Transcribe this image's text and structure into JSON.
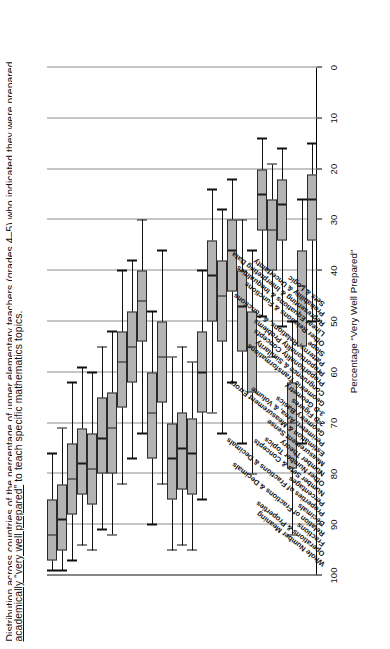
{
  "caption": {
    "line_clipped": "Distribution across countries of the percentage of upper elementary teachers (grades 4–5) who indicated they were prepared",
    "line2_a": "academically “very well prepared”",
    "line2_b": " to teach specific mathematics topics."
  },
  "axis": {
    "y_title": "Percentage “Very Well Prepared”",
    "y_ticks": [
      100,
      90,
      80,
      70,
      60,
      50,
      40,
      30,
      20,
      10,
      0
    ],
    "y_min": 0,
    "y_max": 100
  },
  "style": {
    "box_fill": "#b3b3b3",
    "box_stroke": "#2b2b2b",
    "grid_color": "#8d8d8d",
    "whisker_color": "#111111"
  },
  "chart_data": {
    "type": "box",
    "title": "",
    "xlabel": "",
    "ylabel": "Percentage “Very Well Prepared”",
    "ylim": [
      0,
      100
    ],
    "grid": "vertical",
    "orientation": "horizontal",
    "legend": "none",
    "categories": [
      "Whole Number Meaning",
      "Operations & Properties",
      "Fractions",
      "Relation of Fractions & Decimals",
      "Decimals",
      "Properties of Fractions & Decimals",
      "Percentages",
      "Number Sets & Concepts",
      "Other Number Topics",
      "Number Theory",
      "Measurement Sense",
      "Estimation & Measurement Errors",
      "Perimeter, Area, & Volume",
      "Geometry Basics",
      "2-D Figures",
      "3-D Geometry",
      "Geometric Transformations",
      "Congruence & Similarity",
      "Proportionality Concepts",
      "Proportionality Problems",
      "Patterns, Relations, & Functions",
      "Slope",
      "Other Relations & Functions",
      "Linear Equations & Inequalities",
      "Representing & Interpreting Data",
      "Probability & Uncertainty",
      "Sets & Logic"
    ],
    "boxes": [
      {
        "category": "Whole Number Meaning",
        "min": 76,
        "q1": 85,
        "median": 92,
        "q3": 97,
        "max": 99
      },
      {
        "category": "Operations & Properties",
        "min": 71,
        "q1": 82,
        "median": 89,
        "q3": 95,
        "max": 99
      },
      {
        "category": "Fractions",
        "min": 62,
        "q1": 74,
        "median": 81,
        "q3": 88,
        "max": 97
      },
      {
        "category": "Relation of Fractions & Decimals",
        "min": 59,
        "q1": 71,
        "median": 78,
        "q3": 84,
        "max": 94
      },
      {
        "category": "Decimals",
        "min": 60,
        "q1": 72,
        "median": 79,
        "q3": 86,
        "max": 95
      },
      {
        "category": "Properties of Fractions & Decimals",
        "min": 55,
        "q1": 65,
        "median": 73,
        "q3": 80,
        "max": 91
      },
      {
        "category": "Percentages",
        "min": 52,
        "q1": 64,
        "median": 71,
        "q3": 80,
        "max": 92
      },
      {
        "category": "Number Sets & Concepts",
        "min": 40,
        "q1": 52,
        "median": 58,
        "q3": 67,
        "max": 82
      },
      {
        "category": "Other Number Topics",
        "min": 38,
        "q1": 48,
        "median": 55,
        "q3": 62,
        "max": 77
      },
      {
        "category": "Number Theory",
        "min": 30,
        "q1": 40,
        "median": 46,
        "q3": 54,
        "max": 72
      },
      {
        "category": "Measurement Sense",
        "min": 48,
        "q1": 60,
        "median": 68,
        "q3": 77,
        "max": 90
      },
      {
        "category": "Estimation & Measurement Errors",
        "min": 36,
        "q1": 50,
        "median": 57,
        "q3": 66,
        "max": 82
      },
      {
        "category": "Perimeter, Area, & Volume",
        "min": 57,
        "q1": 70,
        "median": 77,
        "q3": 85,
        "max": 95
      },
      {
        "category": "Geometry Basics",
        "min": 55,
        "q1": 68,
        "median": 75,
        "q3": 83,
        "max": 94
      },
      {
        "category": "2-D Figures",
        "min": 58,
        "q1": 69,
        "median": 76,
        "q3": 84,
        "max": 95
      },
      {
        "category": "3-D Geometry",
        "min": 40,
        "q1": 52,
        "median": 60,
        "q3": 68,
        "max": 85
      },
      {
        "category": "Geometric Transformations",
        "min": 24,
        "q1": 34,
        "median": 41,
        "q3": 50,
        "max": 68
      },
      {
        "category": "Congruence & Similarity",
        "min": 28,
        "q1": 38,
        "median": 45,
        "q3": 54,
        "max": 72
      },
      {
        "category": "Proportionality Concepts",
        "min": 22,
        "q1": 30,
        "median": 36,
        "q3": 44,
        "max": 62
      },
      {
        "category": "Proportionality Problems",
        "min": 30,
        "q1": 40,
        "median": 47,
        "q3": 56,
        "max": 74
      },
      {
        "category": "Patterns, Relations, & Functions",
        "min": 36,
        "q1": 48,
        "median": 55,
        "q3": 64,
        "max": 80
      },
      {
        "category": "Slope",
        "min": 14,
        "q1": 20,
        "median": 25,
        "q3": 32,
        "max": 49
      },
      {
        "category": "Other Relations & Functions",
        "min": 19,
        "q1": 26,
        "median": 32,
        "q3": 40,
        "max": 57
      },
      {
        "category": "Linear Equations & Inequalities",
        "min": 16,
        "q1": 22,
        "median": 27,
        "q3": 34,
        "max": 51
      },
      {
        "category": "Representing & Interpreting Data",
        "min": 50,
        "q1": 62,
        "median": 70,
        "q3": 79,
        "max": 92
      },
      {
        "category": "Probability & Uncertainty",
        "min": 26,
        "q1": 36,
        "median": 43,
        "q3": 55,
        "max": 74
      },
      {
        "category": "Sets & Logic",
        "min": 15,
        "q1": 21,
        "median": 26,
        "q3": 34,
        "max": 50
      }
    ]
  }
}
